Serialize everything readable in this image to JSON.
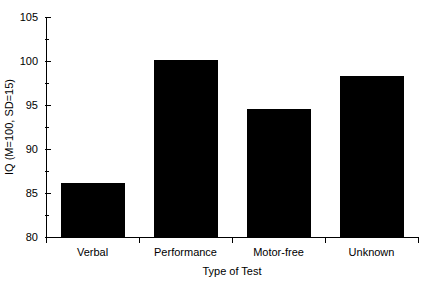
{
  "chart_data": {
    "type": "bar",
    "title": "",
    "subtitle": "",
    "categories": [
      "Verbal",
      "Performance",
      "Motor-free",
      "Unknown"
    ],
    "values": [
      86.1,
      100.1,
      94.6,
      98.3
    ],
    "xlabel": "Type of Test",
    "ylabel": "IQ (M=100, SD=15)",
    "ylim": [
      80,
      105
    ],
    "ytick_labels": [
      "80",
      "85",
      "90",
      "95",
      "100",
      "105"
    ],
    "ytick_values": [
      80,
      85,
      90,
      95,
      100,
      105
    ],
    "yminor_values": [
      82.5,
      87.5,
      92.5,
      97.5,
      102.5
    ],
    "grid": false,
    "legend": false,
    "bar_color": "#000000",
    "axis_color": "#000000",
    "background_color": "#ffffff"
  }
}
